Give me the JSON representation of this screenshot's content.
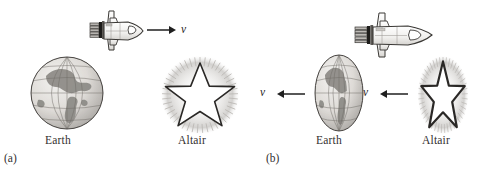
{
  "figure": {
    "background_color": "#ffffff",
    "ink_color": "#2b2b2b",
    "topic": "relativistic-length-contraction"
  },
  "panels": [
    {
      "id": "a",
      "letter": "(a)",
      "frame": "earth-frame",
      "objects": {
        "earth": {
          "label": "Earth",
          "shape": "circle",
          "contracted": false,
          "center_x": 67,
          "center_y": 93,
          "radius_x": 37,
          "radius_y": 37
        },
        "star": {
          "label": "Altair",
          "shape": "star-with-halo",
          "contracted": false,
          "center_x": 200,
          "center_y": 95,
          "radius_x": 36,
          "radius_y": 36,
          "points": 5
        },
        "shuttle": {
          "name": "space-shuttle",
          "contracted": true,
          "direction": "right",
          "center_x": 117,
          "center_y": 30,
          "length": 52,
          "height": 38
        }
      },
      "arrows": [
        {
          "name": "shuttle-velocity-arrow",
          "direction": "right",
          "label": "v",
          "x": 148,
          "y": 30,
          "length": 24
        }
      ]
    },
    {
      "id": "b",
      "letter": "(b)",
      "frame": "shuttle-frame",
      "objects": {
        "earth": {
          "label": "Earth",
          "shape": "ellipse",
          "contracted": true,
          "center_x": 95,
          "center_y": 93,
          "radius_x": 24,
          "radius_y": 38
        },
        "star": {
          "label": "Altair",
          "shape": "star-with-halo",
          "contracted": true,
          "center_x": 198,
          "center_y": 95,
          "radius_x": 24,
          "radius_y": 38,
          "points": 5
        },
        "shuttle": {
          "name": "space-shuttle",
          "contracted": false,
          "direction": "right",
          "center_x": 148,
          "center_y": 34,
          "length": 76,
          "height": 42
        }
      },
      "arrows": [
        {
          "name": "earth-velocity-arrow",
          "direction": "left",
          "label": "v",
          "x": 40,
          "y": 93,
          "length": 26
        },
        {
          "name": "star-velocity-arrow",
          "direction": "left",
          "label": "v",
          "x": 143,
          "y": 93,
          "length": 26
        }
      ]
    }
  ]
}
